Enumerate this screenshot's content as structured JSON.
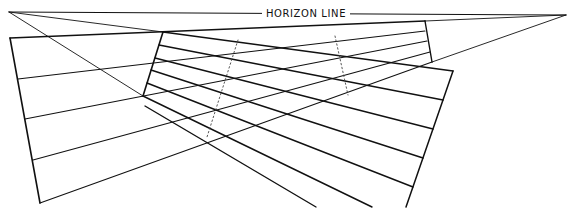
{
  "label": "HORIZON LINE",
  "colors": {
    "line": "#111111",
    "background": "#ffffff",
    "dotted": "#444444"
  },
  "vanishing_points": {
    "left": [
      9,
      12
    ],
    "right": [
      566,
      15
    ]
  },
  "horizon": {
    "x1": 9,
    "y1": 12,
    "x2": 566,
    "y2": 15,
    "label_x": 306,
    "label_y": 17
  },
  "construction_lines": [
    {
      "x1": 9,
      "y1": 12,
      "x2": 163,
      "y2": 32
    },
    {
      "x1": 9,
      "y1": 12,
      "x2": 143,
      "y2": 96
    },
    {
      "x1": 566,
      "y1": 15,
      "x2": 432,
      "y2": 62
    },
    {
      "x1": 566,
      "y1": 15,
      "x2": 425,
      "y2": 21
    }
  ],
  "left_plane": {
    "top": {
      "x1": 10,
      "y1": 38,
      "x2": 425,
      "y2": 21
    },
    "left": {
      "x1": 10,
      "y1": 38,
      "x2": 40,
      "y2": 203
    },
    "rows": [
      {
        "x1": 18,
        "y1": 79,
        "x2": 425,
        "y2": 31
      },
      {
        "x1": 25,
        "y1": 119,
        "x2": 427,
        "y2": 41
      },
      {
        "x1": 33,
        "y1": 160,
        "x2": 430,
        "y2": 52
      },
      {
        "x1": 40,
        "y1": 203,
        "x2": 432,
        "y2": 62
      }
    ]
  },
  "inner_plane": {
    "left": {
      "x1": 163,
      "y1": 32,
      "x2": 143,
      "y2": 96
    },
    "right": {
      "x1": 425,
      "y1": 21,
      "x2": 432,
      "y2": 62
    }
  },
  "right_plane": {
    "right": {
      "x1": 453,
      "y1": 71,
      "x2": 406,
      "y2": 207
    },
    "rows": [
      {
        "x1": 163,
        "y1": 32,
        "x2": 453,
        "y2": 71
      },
      {
        "x1": 159,
        "y1": 45,
        "x2": 443,
        "y2": 100
      },
      {
        "x1": 155,
        "y1": 58,
        "x2": 433,
        "y2": 129
      },
      {
        "x1": 151,
        "y1": 70,
        "x2": 423,
        "y2": 158
      },
      {
        "x1": 147,
        "y1": 83,
        "x2": 413,
        "y2": 187
      },
      {
        "x1": 143,
        "y1": 96,
        "x2": 372,
        "y2": 207
      },
      {
        "x1": 145,
        "y1": 106,
        "x2": 316,
        "y2": 207
      }
    ]
  },
  "dotted_lines": [
    {
      "x1": 238,
      "y1": 40,
      "x2": 207,
      "y2": 137
    },
    {
      "x1": 335,
      "y1": 36,
      "x2": 348,
      "y2": 95
    }
  ]
}
